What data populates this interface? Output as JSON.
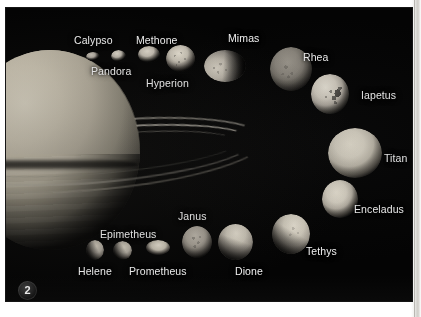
{
  "figure": {
    "number": "2",
    "background_color": "#040404",
    "label_color": "#f2f2f2"
  },
  "primary_body": {
    "name": "Saturn",
    "name_shown": false
  },
  "moons": [
    {
      "id": "calypso",
      "label": "Calypso",
      "label_x": 68,
      "label_y": 27,
      "body_x": 80,
      "body_y": 44,
      "w": 14,
      "h": 9,
      "brightness": "#b9b3a8"
    },
    {
      "id": "pandora",
      "label": "Pandora",
      "label_x": 85,
      "label_y": 58,
      "body_x": 105,
      "body_y": 42,
      "w": 15,
      "h": 12,
      "brightness": "#cfc9bd"
    },
    {
      "id": "methone",
      "label": "Methone",
      "label_x": 130,
      "label_y": 27,
      "body_x": 132,
      "body_y": 38,
      "w": 22,
      "h": 17,
      "brightness": "#cdc7ba"
    },
    {
      "id": "hyperion",
      "label": "Hyperion",
      "label_x": 140,
      "label_y": 70,
      "body_x": 160,
      "body_y": 37,
      "w": 29,
      "h": 27,
      "brightness": "#d0cabd"
    },
    {
      "id": "mimas",
      "label": "Mimas",
      "label_x": 222,
      "label_y": 25,
      "body_x": 198,
      "body_y": 42,
      "w": 42,
      "h": 32,
      "brightness": "#cbc5b9"
    },
    {
      "id": "rhea",
      "label": "Rhea",
      "label_x": 297,
      "label_y": 44,
      "body_x": 264,
      "body_y": 39,
      "w": 42,
      "h": 44,
      "brightness": "#8e8a80"
    },
    {
      "id": "iapetus",
      "label": "Iapetus",
      "label_x": 355,
      "label_y": 82,
      "body_x": 305,
      "body_y": 66,
      "w": 38,
      "h": 40,
      "brightness": "#d6d1c6"
    },
    {
      "id": "titan",
      "label": "Titan",
      "label_x": 378,
      "label_y": 145,
      "body_x": 322,
      "body_y": 120,
      "w": 54,
      "h": 50,
      "brightness": "#e0dacc"
    },
    {
      "id": "enceladus",
      "label": "Enceladus",
      "label_x": 348,
      "label_y": 196,
      "body_x": 316,
      "body_y": 172,
      "w": 36,
      "h": 38,
      "brightness": "#ddd7cb"
    },
    {
      "id": "tethys",
      "label": "Tethys",
      "label_x": 300,
      "label_y": 238,
      "body_x": 266,
      "body_y": 206,
      "w": 38,
      "h": 40,
      "brightness": "#d9d3c7"
    },
    {
      "id": "dione",
      "label": "Dione",
      "label_x": 229,
      "label_y": 258,
      "body_x": 212,
      "body_y": 216,
      "w": 35,
      "h": 36,
      "brightness": "#cbc5b9"
    },
    {
      "id": "janus",
      "label": "Janus",
      "label_x": 172,
      "label_y": 203,
      "body_x": 176,
      "body_y": 218,
      "w": 30,
      "h": 32,
      "brightness": "#a6a096"
    },
    {
      "id": "prometheus",
      "label": "Prometheus",
      "label_x": 123,
      "label_y": 258,
      "body_x": 140,
      "body_y": 232,
      "w": 24,
      "h": 15,
      "brightness": "#cfc9bc"
    },
    {
      "id": "epimetheus",
      "label": "Epimetheus",
      "label_x": 94,
      "label_y": 221,
      "body_x": 107,
      "body_y": 233,
      "w": 19,
      "h": 19,
      "brightness": "#bdb7ac"
    },
    {
      "id": "helene",
      "label": "Helene",
      "label_x": 72,
      "label_y": 258,
      "body_x": 80,
      "body_y": 232,
      "w": 18,
      "h": 20,
      "brightness": "#b3ada2"
    }
  ]
}
